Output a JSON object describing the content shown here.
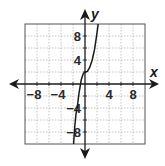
{
  "chart_data": {
    "type": "line",
    "title": "",
    "xlabel": "x",
    "ylabel": "y",
    "xlim": [
      -10,
      10
    ],
    "ylim": [
      -10,
      10
    ],
    "grid": true,
    "grid_step": 2,
    "x_ticks": [
      -8,
      -4,
      4,
      8
    ],
    "y_ticks": [
      8,
      4,
      -4,
      -8
    ],
    "x_tick_labels": [
      "−8",
      "−4",
      "4",
      "8"
    ],
    "y_tick_labels": [
      "8",
      "4",
      "−4",
      "−8"
    ],
    "series": [
      {
        "name": "cubic curve",
        "description": "Cubic-shaped curve with inflection point at (0, 2); increasing; exits top near x=2.2 and bottom near x=-1.9",
        "points": [
          [
            -1.9,
            -10
          ],
          [
            -1.7,
            -7
          ],
          [
            -1.5,
            -5
          ],
          [
            -1.3,
            -4
          ],
          [
            -1.0,
            -1.5
          ],
          [
            -0.6,
            0.8
          ],
          [
            -0.3,
            1.7
          ],
          [
            0,
            2
          ],
          [
            0.4,
            2.1
          ],
          [
            0.8,
            2.8
          ],
          [
            1.2,
            4
          ],
          [
            1.6,
            5.8
          ],
          [
            1.9,
            7.8
          ],
          [
            2.2,
            10
          ]
        ]
      }
    ],
    "colors": {
      "curve": "#1a1a1a",
      "axes": "#1a1a1a",
      "grid": "#9a9a9a",
      "border": "#555555"
    }
  },
  "axes": {
    "x_name": "x",
    "y_name": "y"
  }
}
